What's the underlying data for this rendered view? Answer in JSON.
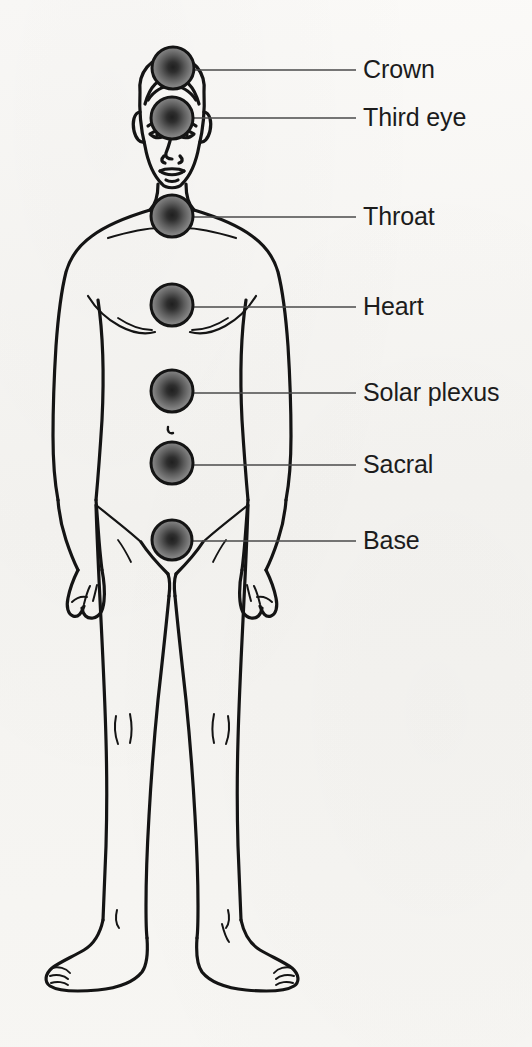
{
  "diagram": {
    "figure": "standing male body line drawing, front view",
    "background_color": "#f7f6f4",
    "line_color": "#1a1a1a",
    "leader_line_color": "#4a4a4a",
    "label_text_color": "#1c1c1c",
    "point_center_color": "#262626",
    "point_edge_color": "#8d8d8d",
    "point_ring_color": "#141414"
  },
  "points": [
    {
      "id": "crown",
      "label": "Crown",
      "dot_cx": 173,
      "dot_cy": 68,
      "dot_r": 21,
      "line_x1": 194,
      "line_x2": 356,
      "line_y": 70,
      "label_x": 363,
      "label_y": 70
    },
    {
      "id": "third-eye",
      "label": "Third eye",
      "dot_cx": 172,
      "dot_cy": 118,
      "dot_r": 21,
      "line_x1": 193,
      "line_x2": 356,
      "line_y": 118,
      "label_x": 363,
      "label_y": 118
    },
    {
      "id": "throat",
      "label": "Throat",
      "dot_cx": 172,
      "dot_cy": 216,
      "dot_r": 21,
      "line_x1": 193,
      "line_x2": 356,
      "line_y": 217,
      "label_x": 363,
      "label_y": 217
    },
    {
      "id": "heart",
      "label": "Heart",
      "dot_cx": 172,
      "dot_cy": 305,
      "dot_r": 21,
      "line_x1": 193,
      "line_x2": 356,
      "line_y": 307,
      "label_x": 363,
      "label_y": 307
    },
    {
      "id": "solar-plexus",
      "label": "Solar plexus",
      "dot_cx": 172,
      "dot_cy": 391,
      "dot_r": 21,
      "line_x1": 193,
      "line_x2": 356,
      "line_y": 393,
      "label_x": 363,
      "label_y": 393
    },
    {
      "id": "sacral",
      "label": "Sacral",
      "dot_cx": 172,
      "dot_cy": 463,
      "dot_r": 21,
      "line_x1": 193,
      "line_x2": 356,
      "line_y": 465,
      "label_x": 363,
      "label_y": 465
    },
    {
      "id": "base",
      "label": "Base",
      "dot_cx": 172,
      "dot_cy": 540,
      "dot_r": 20,
      "line_x1": 192,
      "line_x2": 356,
      "line_y": 541,
      "label_x": 363,
      "label_y": 541
    }
  ]
}
